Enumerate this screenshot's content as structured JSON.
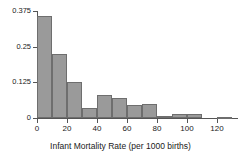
{
  "chart_data": {
    "type": "bar",
    "title": "",
    "subtitle": "",
    "xlabel": "Infant Mortality Rate (per 1000 births)",
    "ylabel": "",
    "xlim": [
      0,
      134
    ],
    "ylim": [
      0,
      0.375
    ],
    "xticks": [
      0,
      20,
      40,
      60,
      80,
      100,
      120
    ],
    "xtick_labels": [
      "0",
      "20",
      "40",
      "60",
      "80",
      "100",
      "120"
    ],
    "yticks": [
      0,
      0.125,
      0.25,
      0.375
    ],
    "ytick_labels": [
      "0",
      "0.125",
      "0.25",
      "0.375"
    ],
    "grid": false,
    "legend": false,
    "bin_width": 10,
    "bin_edges": [
      0,
      10,
      20,
      30,
      40,
      50,
      60,
      70,
      80,
      90,
      100,
      110,
      120,
      130
    ],
    "categories": [
      "0-10",
      "10-20",
      "20-30",
      "30-40",
      "40-50",
      "50-60",
      "60-70",
      "70-80",
      "80-90",
      "90-100",
      "100-110",
      "110-120",
      "120-130"
    ],
    "values": [
      0.358,
      0.226,
      0.125,
      0.035,
      0.081,
      0.069,
      0.044,
      0.05,
      0.006,
      0.014,
      0.014,
      0,
      0.005
    ],
    "bar_fill_color": "#9a9a9a",
    "bar_edge_color": "#6e6e6e",
    "axis_color": "#555555"
  }
}
